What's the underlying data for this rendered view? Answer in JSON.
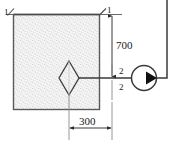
{
  "diagram": {
    "type": "engineering-schematic",
    "background_color": "#ffffff",
    "line_color": "#3a3a3a",
    "fill_texture_color": "#cfcfcf",
    "tank": {
      "name": "fluid-tank",
      "fill": "stippled",
      "fill_color": "#f2f2f2"
    },
    "sections": [
      {
        "id": "1",
        "label_left": "1",
        "label_right": "1",
        "position": "free-surface-top"
      },
      {
        "id": "2",
        "label_top": "2",
        "label_bottom": "2",
        "position": "pump-suction-centerline"
      }
    ],
    "dimensions": [
      {
        "name": "vertical-height",
        "value": "700",
        "orientation": "vertical"
      },
      {
        "name": "horizontal-offset",
        "value": "300",
        "orientation": "horizontal"
      }
    ],
    "symbols": [
      {
        "name": "valve-diamond",
        "shape": "diamond",
        "description": "inlet-valve"
      },
      {
        "name": "pump",
        "shape": "circle-with-triangle",
        "description": "centrifugal-pump"
      },
      {
        "name": "flow-arrow",
        "shape": "filled-triangle",
        "direction": "right"
      }
    ]
  }
}
